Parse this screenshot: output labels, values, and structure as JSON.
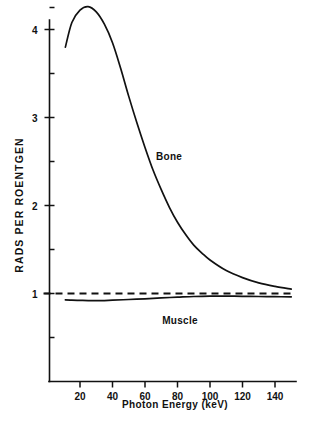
{
  "chart_data": {
    "type": "line",
    "title": "",
    "xlabel": "Photon Energy  (keV)",
    "ylabel": "RADS PER ROENTGEN",
    "xlim": [
      0,
      151
    ],
    "ylim": [
      0,
      4.55
    ],
    "grid": false,
    "legend_position": "inline-annotation",
    "xticks": [
      20,
      40,
      60,
      80,
      100,
      120,
      140
    ],
    "xtick_labels": [
      "20",
      "40",
      "60",
      "80",
      "100",
      "120",
      "140"
    ],
    "yticks": [
      1,
      2,
      3,
      4
    ],
    "ytick_labels": [
      "1",
      "2",
      "3",
      "4"
    ],
    "yticks_minor": [
      0.5,
      1.5,
      2.5,
      3.5,
      4.25
    ],
    "annotations": [
      {
        "text": "Bone",
        "x": 66,
        "y": 2.58
      },
      {
        "text": "Muscle",
        "x": 82,
        "y": 0.79
      }
    ],
    "reference_lines": [
      {
        "value": 1.0,
        "style": "dashed",
        "orientation": "horizontal"
      }
    ],
    "series": [
      {
        "name": "Bone",
        "style": "solid",
        "x": [
          11,
          15,
          20,
          25,
          30,
          35,
          40,
          45,
          50,
          55,
          60,
          65,
          70,
          75,
          80,
          85,
          90,
          95,
          100,
          110,
          120,
          130,
          140,
          150
        ],
        "values": [
          3.8,
          4.08,
          4.22,
          4.26,
          4.2,
          4.06,
          3.85,
          3.56,
          3.24,
          2.94,
          2.66,
          2.4,
          2.18,
          1.98,
          1.81,
          1.67,
          1.55,
          1.46,
          1.38,
          1.26,
          1.18,
          1.12,
          1.08,
          1.05
        ]
      },
      {
        "name": "Muscle",
        "style": "solid",
        "x": [
          11,
          15,
          20,
          25,
          30,
          35,
          40,
          50,
          60,
          70,
          80,
          90,
          100,
          110,
          120,
          130,
          140,
          150
        ],
        "values": [
          0.928,
          0.925,
          0.922,
          0.919,
          0.918,
          0.92,
          0.924,
          0.932,
          0.94,
          0.95,
          0.958,
          0.966,
          0.97,
          0.97,
          0.968,
          0.966,
          0.964,
          0.962
        ]
      }
    ]
  },
  "axes": {
    "x_title": "Photon Energy  (keV)",
    "y_title": "RADS PER ROENTGEN"
  },
  "labels": {
    "bone": "Bone",
    "muscle": "Muscle"
  }
}
